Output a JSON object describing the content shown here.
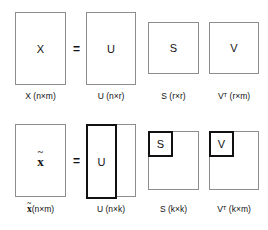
{
  "diagram": {
    "equals_symbol": "=",
    "times_symbol": "×",
    "colors": {
      "box_border": "#8d8d8d",
      "subblock_border": "#111111",
      "background": "#ffffff",
      "text": "#111111"
    },
    "rows": [
      {
        "name": "full-svd",
        "matrices": [
          {
            "symbol": "X",
            "caption_name": "X",
            "caption_dims": "(n×m)",
            "caption": "X (n×m)",
            "shape": "tall-rectangle",
            "truncated": false
          },
          {
            "symbol": "U",
            "caption_name": "U",
            "caption_dims": "(n×r)",
            "caption": "U (n×r)",
            "shape": "tall-rectangle",
            "truncated": false
          },
          {
            "symbol": "S",
            "caption_name": "S",
            "caption_dims": "(r×r)",
            "caption": "S (r×r)",
            "shape": "square",
            "truncated": false
          },
          {
            "symbol": "V",
            "caption_name": "V",
            "caption_superscript": "T",
            "caption_dims": "(r×m)",
            "caption": "Vᵀ (r×m)",
            "shape": "square",
            "truncated": false
          }
        ]
      },
      {
        "name": "truncated-svd",
        "matrices": [
          {
            "symbol": "x̃",
            "caption_name": "x̃",
            "caption_dims": "(n×m)",
            "caption": "x̃ (n×m)",
            "shape": "tall-rectangle",
            "truncated": false
          },
          {
            "symbol": "U",
            "caption_name": "U",
            "caption_dims": "(n×k)",
            "caption": "U (n×k)",
            "shape": "tall-rectangle",
            "truncated": true,
            "highlight": "left-columns"
          },
          {
            "symbol": "S",
            "caption_name": "S",
            "caption_dims": "(k×k)",
            "caption": "S (k×k)",
            "shape": "square",
            "truncated": true,
            "highlight": "top-left-block"
          },
          {
            "symbol": "V",
            "caption_name": "V",
            "caption_superscript": "T",
            "caption_dims": "(k×m)",
            "caption": "Vᵀ (k×m)",
            "shape": "square",
            "truncated": true,
            "highlight": "top-left-block"
          }
        ]
      }
    ]
  }
}
